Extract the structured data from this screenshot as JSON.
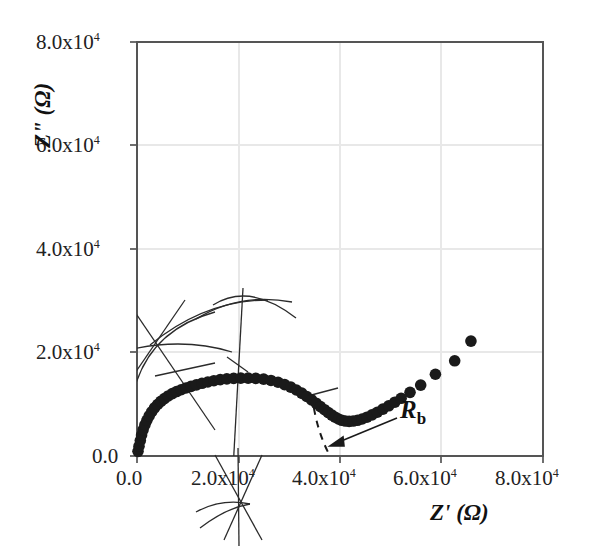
{
  "chart_data": {
    "type": "scatter",
    "title": "",
    "xlabel": "Z' (Ω)",
    "ylabel": "Z\" (Ω)",
    "xlim": [
      0,
      80000
    ],
    "ylim": [
      0,
      80000
    ],
    "xticks": [
      0,
      20000,
      40000,
      60000,
      80000
    ],
    "yticks": [
      0,
      20000,
      40000,
      60000,
      80000
    ],
    "xtick_labels": [
      "0.0",
      "2.0x104",
      "4.0x104",
      "6.0x104",
      "8.0x104"
    ],
    "ytick_labels": [
      "0.0",
      "2.0x104",
      "4.0x104",
      "6.0x104",
      "8.0x104"
    ],
    "grid": true,
    "legend": null,
    "marker": "filled-circle",
    "marker_color": "#1a1a1a",
    "series": [
      {
        "name": "impedance",
        "x": [
          200,
          400,
          650,
          900,
          1200,
          1550,
          1950,
          2400,
          2900,
          3450,
          4050,
          4700,
          5400,
          6150,
          6950,
          7800,
          8700,
          9650,
          10650,
          11700,
          12800,
          13950,
          15150,
          16400,
          17700,
          19050,
          20450,
          21900,
          23400,
          24950,
          26400,
          27800,
          29100,
          30300,
          31400,
          32450,
          33450,
          34400,
          35300,
          36150,
          36950,
          37700,
          38400,
          39050,
          39700,
          40350,
          41050,
          41800,
          42600,
          43450,
          44350,
          45300,
          46300,
          47350,
          48450,
          49600,
          50800,
          52050,
          53800,
          55900,
          58800,
          62600,
          65800
        ],
        "y": [
          900,
          1900,
          3000,
          4050,
          5050,
          6000,
          6900,
          7750,
          8550,
          9300,
          9950,
          10550,
          11100,
          11600,
          12050,
          12450,
          12800,
          13150,
          13450,
          13750,
          14050,
          14300,
          14550,
          14750,
          14900,
          15000,
          15050,
          15050,
          15000,
          14850,
          14600,
          14250,
          13800,
          13300,
          12750,
          12150,
          11500,
          10850,
          10200,
          9550,
          8950,
          8400,
          7900,
          7500,
          7150,
          6900,
          6750,
          6700,
          6750,
          6900,
          7150,
          7500,
          7950,
          8450,
          9050,
          9700,
          10400,
          11150,
          12300,
          13700,
          15800,
          18400,
          22200
        ]
      }
    ],
    "annotations": [
      {
        "text_main": "R",
        "text_sub": "b",
        "meaning": "bulk-resistance-label",
        "arrow_to_x": 38000,
        "arrow_to_y": 1200
      }
    ],
    "extrapolation": {
      "style": "dashed",
      "intercept_x": 38000,
      "note": "dashed guide from trough to Z' axis"
    }
  },
  "axes": {
    "x_title": "Z' (Ω)",
    "y_title": "Z\" (Ω)",
    "frame_color": "#555555",
    "grid_color": "#e8e8e8"
  },
  "labels": {
    "x": [
      "0.0",
      "2.0",
      "4.0",
      "6.0",
      "8.0"
    ],
    "y": [
      "0.0",
      "2.0",
      "4.0",
      "6.0",
      "8.0"
    ],
    "mantissa_suffix": "x10",
    "exponent": "4"
  },
  "annotation_label": {
    "symbol": "R",
    "subscript": "b"
  }
}
